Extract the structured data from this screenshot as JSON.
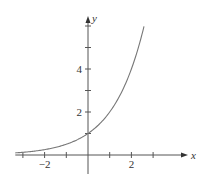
{
  "chart_data": {
    "type": "line",
    "title": "",
    "xlabel": "x",
    "ylabel": "y",
    "xlim": [
      -3.35,
      4.4
    ],
    "ylim": [
      -0.9,
      6.6
    ],
    "x_ticks": [
      -3,
      -2,
      -1,
      1,
      2,
      3
    ],
    "x_tick_labels": [
      {
        "value": -2,
        "label": "−2"
      },
      {
        "value": 2,
        "label": "2"
      }
    ],
    "y_ticks": [
      1,
      2,
      3,
      4,
      5,
      6
    ],
    "y_tick_labels": [
      {
        "value": 2,
        "label": "2"
      },
      {
        "value": 4,
        "label": "4"
      }
    ],
    "grid": false,
    "series": [
      {
        "name": "exponential curve",
        "function": "2^x",
        "x_range": [
          -3.35,
          2.58
        ],
        "x": [
          -3.35,
          -3,
          -2,
          -1,
          0,
          1,
          2,
          2.58
        ],
        "y": [
          0.1,
          0.13,
          0.25,
          0.5,
          1,
          2,
          4,
          6
        ]
      }
    ],
    "legend": "none"
  }
}
